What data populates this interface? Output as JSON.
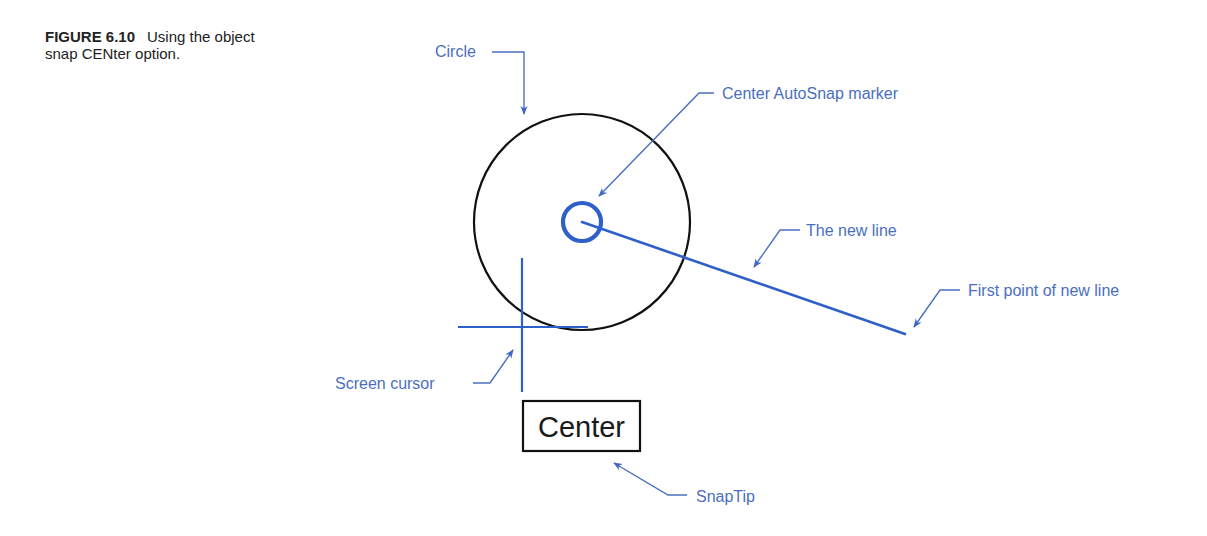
{
  "caption": {
    "figure_number": "FIGURE 6.10",
    "text": "Using the object snap CENter option."
  },
  "colors": {
    "label_text": "#4a6fc0",
    "leader": "#4a6fc0",
    "drawing_blue": "#2f5fc8",
    "drawing_black": "#111111",
    "caption_text": "#222222"
  },
  "drawing": {
    "circle": {
      "cx": 582,
      "cy": 222,
      "r": 108
    },
    "autosnap_marker": {
      "cx": 582,
      "cy": 222,
      "r": 19
    },
    "new_line": {
      "x1": 582,
      "y1": 222,
      "x2": 905,
      "y2": 334
    },
    "crosshair": {
      "vertical": {
        "x": 522,
        "y1": 258,
        "y2": 392
      },
      "horizontal": {
        "y": 327,
        "x1": 458,
        "x2": 588
      }
    },
    "snaptip_box": {
      "x": 523,
      "y": 401,
      "width": 117,
      "height": 50,
      "text": "Center"
    }
  },
  "callouts": [
    {
      "id": "circle",
      "label": "Circle"
    },
    {
      "id": "center-autosnap-marker",
      "label": "Center AutoSnap marker"
    },
    {
      "id": "the-new-line",
      "label": "The new line"
    },
    {
      "id": "first-point",
      "label": "First point of new line"
    },
    {
      "id": "screen-cursor",
      "label": "Screen cursor"
    },
    {
      "id": "snaptip",
      "label": "SnapTip"
    }
  ]
}
